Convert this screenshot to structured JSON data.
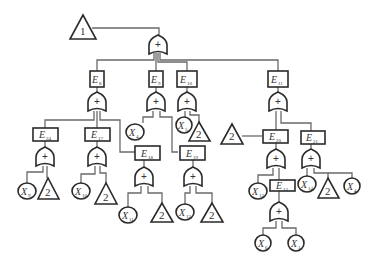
{
  "diagram": {
    "type": "fault-tree",
    "top_transfer": {
      "label": "1"
    },
    "gate_symbol": "+",
    "transfer_symbol": "2",
    "events": {
      "E8": {
        "main": "E",
        "sub": "8"
      },
      "E9": {
        "main": "E",
        "sub": "9"
      },
      "E10": {
        "main": "E",
        "sub": "10"
      },
      "E11": {
        "main": "E",
        "sub": "11"
      },
      "E24": {
        "main": "E",
        "sub": "24"
      },
      "E17": {
        "main": "E",
        "sub": "17"
      },
      "E18": {
        "main": "E",
        "sub": "18"
      },
      "E19": {
        "main": "E",
        "sub": "19"
      },
      "E20": {
        "main": "E",
        "sub": "20"
      },
      "E21": {
        "main": "E",
        "sub": "21"
      },
      "E12": {
        "main": "E",
        "sub": "12"
      }
    },
    "basic": {
      "X9": {
        "main": "X",
        "sub": "9"
      },
      "X10": {
        "main": "X",
        "sub": "10"
      },
      "X11": {
        "main": "X",
        "sub": "11"
      },
      "X12": {
        "main": "X",
        "sub": "12"
      },
      "X4a": {
        "main": "X",
        "sub": "4"
      },
      "X5": {
        "main": "X",
        "sub": "5"
      },
      "X13": {
        "main": "X",
        "sub": "13"
      },
      "X14": {
        "main": "X",
        "sub": "14"
      },
      "X4b": {
        "main": "X",
        "sub": "4"
      },
      "X6": {
        "main": "X",
        "sub": "6"
      },
      "X1": {
        "main": "X",
        "sub": "1"
      }
    }
  }
}
